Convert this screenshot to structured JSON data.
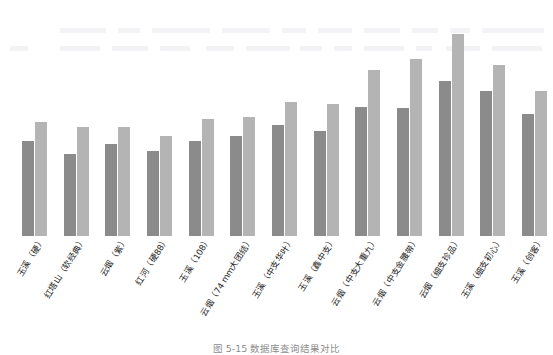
{
  "figure": {
    "caption": "图 5-15   数据库查询结果对比"
  },
  "chart_data": {
    "type": "bar",
    "title": "",
    "subtitle": "",
    "xlabel": "",
    "ylabel": "",
    "ylim": [
      0,
      13.9
    ],
    "grid": false,
    "legend": "none",
    "bar_label_format": "one-decimal",
    "categories": [
      "玉溪（硬）",
      "红塔山（软经典）",
      "云烟（紫）",
      "红河（硬88）",
      "玉溪（108）",
      "云烟（74 mm大团结）",
      "玉溪（中支华叶）",
      "玉溪（鑫中支）",
      "云烟（中支大重九）",
      "云烟（中支金腰带）",
      "云烟（细支珍品）",
      "玉溪（细支初心）",
      "玉溪（创客）"
    ],
    "series": [
      {
        "name": "series-1",
        "color": "#8b8b8b",
        "values": [
          6.2,
          5.3,
          6.0,
          5.5,
          6.2,
          6.5,
          7.2,
          6.8,
          8.4,
          8.3,
          10.1,
          9.4,
          7.9
        ]
      },
      {
        "name": "series-2",
        "color": "#b4b4b4",
        "values": [
          7.4,
          7.1,
          7.1,
          6.5,
          7.6,
          7.7,
          8.7,
          8.6,
          10.8,
          11.5,
          13.1,
          11.1,
          9.4
        ]
      }
    ]
  },
  "ghost_rows": [
    {
      "x": 60,
      "y": 28,
      "w": 46
    },
    {
      "x": 118,
      "y": 28,
      "w": 22
    },
    {
      "x": 152,
      "y": 28,
      "w": 58
    },
    {
      "x": 222,
      "y": 28,
      "w": 48
    },
    {
      "x": 282,
      "y": 28,
      "w": 24
    },
    {
      "x": 318,
      "y": 28,
      "w": 34
    },
    {
      "x": 364,
      "y": 28,
      "w": 36
    },
    {
      "x": 412,
      "y": 28,
      "w": 26
    },
    {
      "x": 450,
      "y": 28,
      "w": 20
    },
    {
      "x": 482,
      "y": 28,
      "w": 62
    },
    {
      "x": 10,
      "y": 46,
      "w": 18
    },
    {
      "x": 60,
      "y": 46,
      "w": 40
    },
    {
      "x": 112,
      "y": 46,
      "w": 36
    },
    {
      "x": 160,
      "y": 46,
      "w": 30
    },
    {
      "x": 206,
      "y": 46,
      "w": 28
    },
    {
      "x": 246,
      "y": 46,
      "w": 44
    },
    {
      "x": 300,
      "y": 46,
      "w": 22
    },
    {
      "x": 334,
      "y": 46,
      "w": 18
    },
    {
      "x": 364,
      "y": 46,
      "w": 40
    },
    {
      "x": 416,
      "y": 46,
      "w": 16
    },
    {
      "x": 446,
      "y": 46,
      "w": 34
    },
    {
      "x": 492,
      "y": 46,
      "w": 50
    }
  ]
}
